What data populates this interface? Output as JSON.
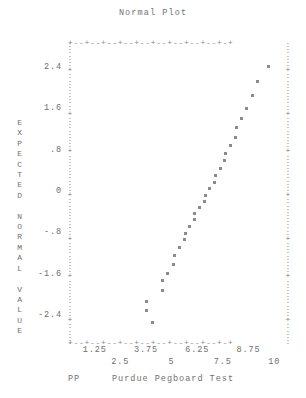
{
  "chart_data": {
    "type": "scatter",
    "title": "Normal Plot",
    "xlabel": "Purdue Pegboard Test",
    "xlabel_prefix": "PP",
    "ylabel": "EXPECTED NORMAL VALUE",
    "ylabel_chars": [
      "E",
      "X",
      "P",
      "E",
      "C",
      "T",
      "E",
      "D",
      "",
      "N",
      "O",
      "R",
      "M",
      "A",
      "L",
      "",
      "V",
      "A",
      "L",
      "U",
      "E"
    ],
    "xlim": [
      0.0,
      10.625
    ],
    "ylim": [
      -2.9,
      2.9
    ],
    "grid": false,
    "legend": null,
    "x_tick_labels_row1": [
      "1.25",
      "3.75",
      "6.25",
      "8.75"
    ],
    "x_tick_values_row1": [
      1.25,
      3.75,
      6.25,
      8.75
    ],
    "x_tick_labels_row2": [
      "2.5",
      "5",
      "7.5",
      "10"
    ],
    "x_tick_values_row2": [
      2.5,
      5,
      7.5,
      10
    ],
    "y_tick_labels": [
      "2.4",
      "1.6",
      ".8",
      "0",
      "-.8",
      "-1.6",
      "-2.4"
    ],
    "y_tick_values": [
      2.4,
      1.6,
      0.8,
      0,
      -0.8,
      -1.6,
      -2.4
    ],
    "points": [
      {
        "x": 4.05,
        "y": -2.52
      },
      {
        "x": 3.78,
        "y": -2.3
      },
      {
        "x": 3.78,
        "y": -2.12
      },
      {
        "x": 4.55,
        "y": -1.9
      },
      {
        "x": 4.58,
        "y": -1.72
      },
      {
        "x": 4.82,
        "y": -1.58
      },
      {
        "x": 5.1,
        "y": -1.4
      },
      {
        "x": 5.14,
        "y": -1.22
      },
      {
        "x": 5.4,
        "y": -1.08
      },
      {
        "x": 5.62,
        "y": -0.92
      },
      {
        "x": 5.66,
        "y": -0.8
      },
      {
        "x": 5.88,
        "y": -0.66
      },
      {
        "x": 6.1,
        "y": -0.54
      },
      {
        "x": 6.14,
        "y": -0.42
      },
      {
        "x": 6.38,
        "y": -0.3
      },
      {
        "x": 6.6,
        "y": -0.18
      },
      {
        "x": 6.64,
        "y": -0.06
      },
      {
        "x": 6.86,
        "y": 0.06
      },
      {
        "x": 7.1,
        "y": 0.18
      },
      {
        "x": 7.14,
        "y": 0.32
      },
      {
        "x": 7.38,
        "y": 0.46
      },
      {
        "x": 7.6,
        "y": 0.6
      },
      {
        "x": 7.64,
        "y": 0.74
      },
      {
        "x": 7.88,
        "y": 0.9
      },
      {
        "x": 8.12,
        "y": 1.06
      },
      {
        "x": 8.16,
        "y": 1.24
      },
      {
        "x": 8.4,
        "y": 1.42
      },
      {
        "x": 8.66,
        "y": 1.62
      },
      {
        "x": 8.92,
        "y": 1.86
      },
      {
        "x": 9.18,
        "y": 2.14
      },
      {
        "x": 9.72,
        "y": 2.42
      }
    ]
  },
  "chart": {
    "title": "Normal Plot",
    "y_axis_title": "E\nX\nP\nE\nC\nT\nE\nD\n\nN\nO\nR\nM\nA\nL\n\nV\nA\nL\nU\nE",
    "caption_pp": "PP",
    "caption_main": "Purdue Pegboard Test"
  }
}
